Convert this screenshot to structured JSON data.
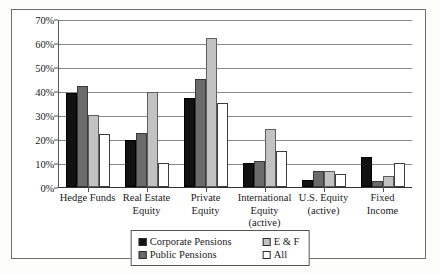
{
  "chart_data": {
    "type": "bar",
    "title": "",
    "xlabel": "",
    "ylabel": "",
    "ylim": [
      0,
      70
    ],
    "ytick_step": 10,
    "ytick_suffix": "%",
    "yticks": [
      "70%",
      "60%",
      "50%",
      "40%",
      "30%",
      "20%",
      "10%",
      "0%"
    ],
    "grid": true,
    "legend_position": "bottom-center",
    "categories": [
      "Hedge Funds",
      "Real Estate Equity",
      "Private Equity",
      "International Equity (active)",
      "U.S. Equity (active)",
      "Fixed Income"
    ],
    "category_lines": [
      [
        "Hedge Funds"
      ],
      [
        "Real Estate",
        "Equity"
      ],
      [
        "Private Equity"
      ],
      [
        "International",
        "Equity (active)"
      ],
      [
        "U.S. Equity",
        "(active)"
      ],
      [
        "Fixed Income"
      ]
    ],
    "series": [
      {
        "name": "Corporate Pensions",
        "color": "#111111",
        "values": [
          39,
          19.5,
          37,
          10,
          3,
          12.5
        ]
      },
      {
        "name": "Public Pensions",
        "color": "#6b6b6b",
        "values": [
          42,
          22.5,
          45,
          11,
          6.5,
          2.5
        ]
      },
      {
        "name": "E & F",
        "color": "#c2c2c2",
        "values": [
          30,
          39.5,
          62,
          24,
          6.5,
          4.5
        ]
      },
      {
        "name": "All",
        "color": "#ffffff",
        "values": [
          22,
          10,
          35,
          15,
          5.5,
          10
        ]
      }
    ]
  }
}
